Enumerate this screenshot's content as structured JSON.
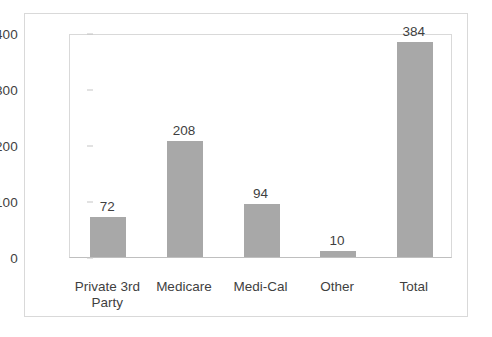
{
  "chart_data": {
    "type": "bar",
    "title": "",
    "subtitle": "",
    "xlabel": "",
    "ylabel": "",
    "categories": [
      "Private 3rd Party",
      "Medicare",
      "Medi-Cal",
      "Other",
      "Total"
    ],
    "category_lines": [
      [
        "Private 3rd",
        "Party"
      ],
      [
        "Medicare"
      ],
      [
        "Medi-Cal"
      ],
      [
        "Other"
      ],
      [
        "Total"
      ]
    ],
    "values": [
      72,
      208,
      94,
      10,
      384
    ],
    "value_labels": [
      "72",
      "208",
      "94",
      "10",
      "384"
    ],
    "ylim": [
      0,
      400
    ],
    "yticks": [
      0,
      100,
      200,
      300,
      400
    ],
    "ytick_labels": [
      "0",
      "100",
      "200",
      "300",
      "400"
    ],
    "grid": false,
    "legend": false,
    "legend_position": "none",
    "bar_color": "#a8a8a8",
    "frame_color": "#d9d9d9",
    "axis_color": "#bfbfbf",
    "text_color": "#3f3f3f",
    "background": "#ffffff"
  }
}
